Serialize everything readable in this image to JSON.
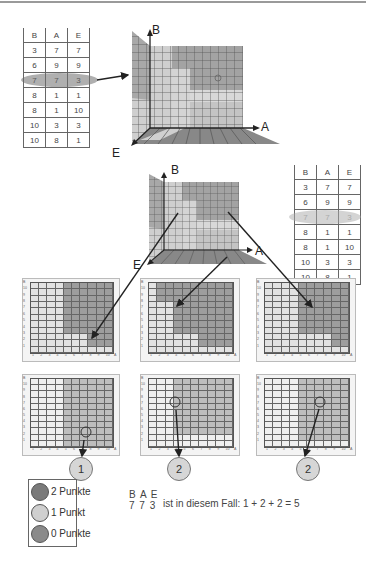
{
  "table_top": {
    "headers": [
      "B",
      "A",
      "E"
    ],
    "rows": [
      [
        "3",
        "7",
        "7"
      ],
      [
        "6",
        "9",
        "9"
      ],
      [
        "7",
        "7",
        "3"
      ],
      [
        "8",
        "1",
        "1"
      ],
      [
        "8",
        "1",
        "10"
      ],
      [
        "10",
        "3",
        "3"
      ],
      [
        "10",
        "8",
        "1"
      ]
    ],
    "highlighted_row": 2
  },
  "table_right": {
    "headers": [
      "B",
      "A",
      "E"
    ],
    "rows": [
      [
        "3",
        "7",
        "7"
      ],
      [
        "6",
        "9",
        "9"
      ],
      [
        "7",
        "7",
        "3"
      ],
      [
        "8",
        "1",
        "1"
      ],
      [
        "8",
        "1",
        "10"
      ],
      [
        "10",
        "3",
        "3"
      ],
      [
        "10",
        "8",
        "1"
      ]
    ],
    "highlighted_row": 2
  },
  "cube_top": {
    "axis_b": "B",
    "axis_a": "A",
    "axis_e": "E"
  },
  "cube_mid": {
    "axis_b": "B",
    "axis_a": "A",
    "axis_e": "E"
  },
  "grids": {
    "y_ticks": [
      "B",
      "10",
      "9",
      "8",
      "7",
      "6",
      "5",
      "4",
      "3",
      "2",
      "1"
    ],
    "x_ticks": [
      "1",
      "2",
      "3",
      "4",
      "5",
      "6",
      "7",
      "8",
      "9",
      "10",
      "A"
    ]
  },
  "scores": [
    "1",
    "2",
    "2"
  ],
  "legend": {
    "items": [
      {
        "label": "2 Punkte",
        "icon": "happy-face-icon"
      },
      {
        "label": "1 Punkt",
        "icon": "neutral-face-icon"
      },
      {
        "label": "0 Punkte",
        "icon": "sad-face-icon"
      }
    ]
  },
  "example": {
    "header": "B A E",
    "values": "7 7 3",
    "formula": "ist in diesem Fall: 1 + 2 + 2 = 5"
  },
  "colors": {
    "dark_cell": "#9d9d9d",
    "mid_cell": "#bdbdbd",
    "light_cell": "#e2e2e2",
    "highlight_oval": "#8f8f8f"
  }
}
